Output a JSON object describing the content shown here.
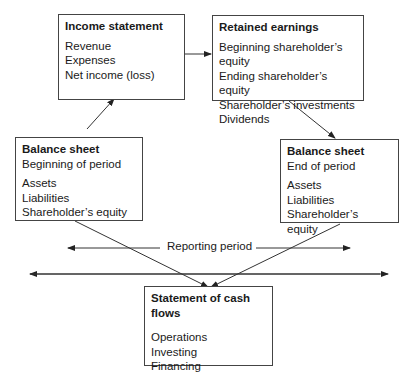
{
  "diagram": {
    "income_statement": {
      "title": "Income statement",
      "items": [
        "Revenue",
        "Expenses",
        "Net income (loss)"
      ]
    },
    "retained_earnings": {
      "title": "Retained earnings",
      "items": [
        "Beginning shareholder’s equity",
        "Ending shareholder’s equity",
        "Shareholder’s investments",
        "Dividends"
      ]
    },
    "balance_sheet_begin": {
      "title": "Balance sheet",
      "subtitle": "Beginning of period",
      "items": [
        "Assets",
        "Liabilities",
        "Shareholder’s equity"
      ]
    },
    "balance_sheet_end": {
      "title": "Balance sheet",
      "subtitle": "End of period",
      "items": [
        "Assets",
        "Liabilities",
        "Shareholder’s equity"
      ]
    },
    "cash_flows": {
      "title": "Statement of cash flows",
      "items": [
        "Operations",
        "Investing",
        "Financing"
      ]
    },
    "reporting_period_label": "Reporting period"
  }
}
